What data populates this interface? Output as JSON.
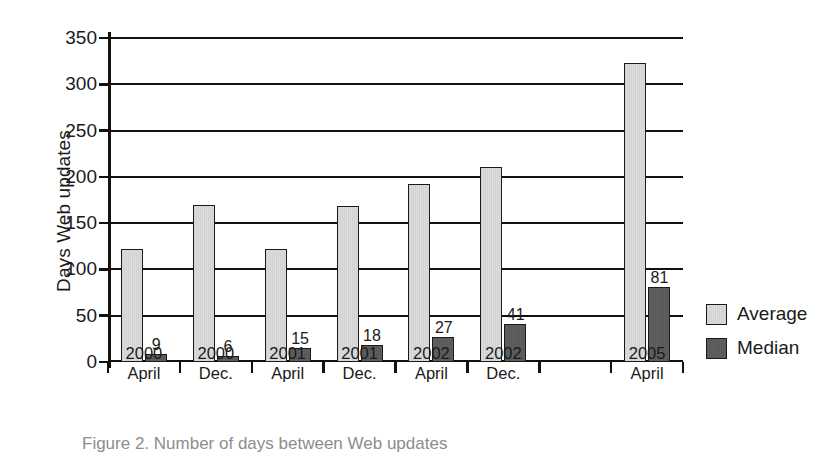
{
  "chart_data": {
    "type": "bar",
    "title": "",
    "xlabel": "",
    "ylabel": "Days Web updates",
    "ylim": [
      0,
      350
    ],
    "yticks": [
      0,
      50,
      100,
      150,
      200,
      250,
      300,
      350
    ],
    "ytick_labels": [
      "0",
      "50",
      "100",
      "150",
      "200",
      "250",
      "300",
      "350"
    ],
    "grid": true,
    "legend_position": "right",
    "categories": [
      "2000 April",
      "2000 Dec.",
      "2001 April",
      "2001 Dec.",
      "2002 April",
      "2002 Dec.",
      "",
      "2005 April"
    ],
    "category_lines": [
      [
        "2000",
        "April"
      ],
      [
        "2000",
        "Dec."
      ],
      [
        "2001",
        "April"
      ],
      [
        "2001",
        "Dec."
      ],
      [
        "2002",
        "April"
      ],
      [
        "2002",
        "Dec."
      ],
      [
        "",
        ""
      ],
      [
        "2005",
        "April"
      ]
    ],
    "series": [
      {
        "name": "Average",
        "color": "#d8d8d8",
        "values": [
          122,
          170,
          122,
          168,
          192,
          211,
          null,
          323
        ],
        "labels": [
          "",
          "",
          "",
          "",
          "",
          "",
          "",
          ""
        ]
      },
      {
        "name": "Median",
        "color": "#5c5c5c",
        "values": [
          9,
          6,
          15,
          18,
          27,
          41,
          null,
          81
        ],
        "labels": [
          "9",
          "6",
          "15",
          "18",
          "27",
          "41",
          "",
          "81"
        ]
      }
    ]
  },
  "legend": {
    "items": [
      {
        "label": "Average",
        "swatch": "avg"
      },
      {
        "label": "Median",
        "swatch": "med"
      }
    ]
  },
  "caption": {
    "text": "Figure 2. Number of days between Web updates"
  }
}
